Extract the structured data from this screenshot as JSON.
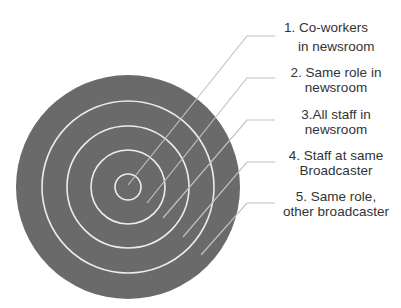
{
  "diagram": {
    "type": "concentric-circles",
    "colors": {
      "disk": "#6a6a6a",
      "rings": "#ececec",
      "leaders": "#c2c2c2",
      "text": "#333333",
      "background": "#ffffff"
    },
    "center": [
      128,
      187
    ],
    "outer_radius": 112,
    "ring_radii": [
      13,
      37,
      61,
      86
    ],
    "layers": [
      {
        "number": 1,
        "line1": "1. Co-workers",
        "line2": "in newsroom",
        "anchor": [
          128,
          185
        ],
        "elbow": [
          247,
          36
        ],
        "end": [
          275,
          36
        ]
      },
      {
        "number": 2,
        "line1": "2. Same role in",
        "line2": "newsroom",
        "anchor": [
          147,
          203
        ],
        "elbow": [
          247,
          78
        ],
        "end": [
          275,
          78
        ]
      },
      {
        "number": 3,
        "line1": "3.All staff in",
        "line2": "newsroom",
        "anchor": [
          163,
          218
        ],
        "elbow": [
          247,
          120
        ],
        "end": [
          275,
          120
        ]
      },
      {
        "number": 4,
        "line1": "4. Staff at same",
        "line2": "Broadcaster",
        "anchor": [
          183,
          237
        ],
        "elbow": [
          247,
          162
        ],
        "end": [
          275,
          162
        ]
      },
      {
        "number": 5,
        "line1": "5. Same role,",
        "line2": "other broadcaster",
        "anchor": [
          201,
          255
        ],
        "elbow": [
          247,
          203
        ],
        "end": [
          275,
          203
        ]
      }
    ]
  }
}
